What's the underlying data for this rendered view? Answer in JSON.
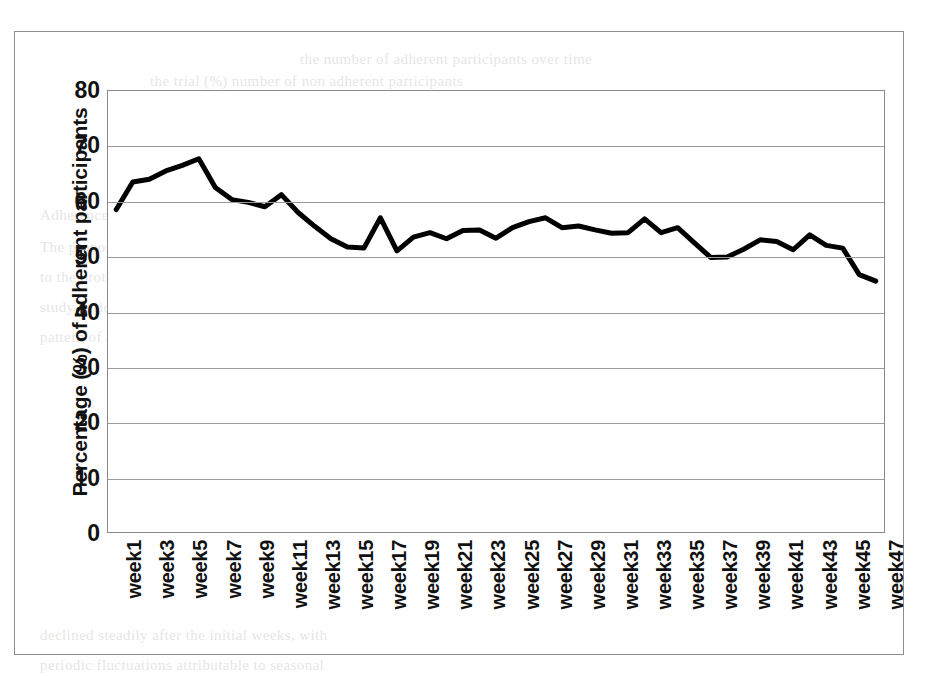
{
  "chart_data": {
    "type": "line",
    "title": "",
    "xlabel": "",
    "ylabel": "Percentage (%) of adherent participants",
    "ylim": [
      0,
      80
    ],
    "ytick_step": 10,
    "yticks": [
      80,
      70,
      60,
      50,
      40,
      30,
      20,
      10,
      0
    ],
    "grid": true,
    "legend": "none",
    "line_color": "#000000",
    "line_width": 5,
    "x": [
      "week1",
      "week2",
      "week3",
      "week4",
      "week5",
      "week6",
      "week7",
      "week8",
      "week9",
      "week10",
      "week11",
      "week12",
      "week13",
      "week14",
      "week15",
      "week16",
      "week17",
      "week18",
      "week19",
      "week20",
      "week21",
      "week22",
      "week23",
      "week24",
      "week25",
      "week26",
      "week27",
      "week28",
      "week29",
      "week30",
      "week31",
      "week32",
      "week33",
      "week34",
      "week35",
      "week36",
      "week37",
      "week38",
      "week39",
      "week40",
      "week41",
      "week42",
      "week43",
      "week44",
      "week45",
      "week46",
      "week47"
    ],
    "xtick_labels": [
      "week1",
      "week3",
      "week5",
      "week7",
      "week9",
      "week11",
      "week13",
      "week15",
      "week17",
      "week19",
      "week21",
      "week23",
      "week25",
      "week27",
      "week29",
      "week31",
      "week33",
      "week35",
      "week37",
      "week39",
      "week41",
      "week43",
      "week45",
      "week47"
    ],
    "values": [
      58.5,
      63.5,
      64.0,
      65.5,
      66.5,
      67.7,
      62.5,
      60.3,
      59.8,
      59.0,
      61.2,
      58.0,
      55.5,
      53.2,
      51.7,
      51.5,
      57.0,
      51.0,
      53.5,
      54.3,
      53.2,
      54.7,
      54.8,
      53.3,
      55.2,
      56.3,
      57.0,
      55.2,
      55.5,
      54.8,
      54.2,
      54.3,
      56.8,
      54.3,
      55.2,
      52.5,
      49.8,
      49.9,
      51.3,
      53.0,
      52.7,
      51.2,
      53.9,
      52.0,
      51.5,
      46.7,
      45.5
    ],
    "series": [
      {
        "name": "Percentage of adherent participants",
        "values": [
          58.5,
          63.5,
          64.0,
          65.5,
          66.5,
          67.7,
          62.5,
          60.3,
          59.8,
          59.0,
          61.2,
          58.0,
          55.5,
          53.2,
          51.7,
          51.5,
          57.0,
          51.0,
          53.5,
          54.3,
          53.2,
          54.7,
          54.8,
          53.3,
          55.2,
          56.3,
          57.0,
          55.2,
          55.5,
          54.8,
          54.2,
          54.3,
          56.8,
          54.3,
          55.2,
          52.5,
          49.8,
          49.9,
          51.3,
          53.0,
          52.7,
          51.2,
          53.9,
          52.0,
          51.5,
          46.7,
          45.5
        ]
      }
    ]
  },
  "page_bleed": {
    "lines": [
      "the number of adherent participants over time",
      "the trial (%) number of non adherent participants",
      "Adherence to the treatment over time",
      "The proportion of participants who remained adherent",
      "to the protocol was monitored weekly throughout the",
      "study period. Figure 1 summarises the observed",
      "pattern of adherence across the 47 weeks of follow up.",
      "Figure 1.  The trend of adherence",
      "declined steadily after the initial weeks, with",
      "periodic fluctuations attributable to seasonal"
    ]
  }
}
